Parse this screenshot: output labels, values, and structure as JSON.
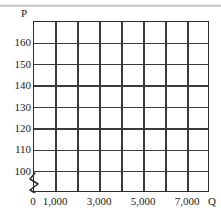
{
  "chart_data": {
    "type": "line",
    "title": "",
    "subtitle": "",
    "xlabel": "Q",
    "ylabel": "P",
    "series": [],
    "x": [],
    "values": [],
    "grid": true,
    "legend": "none",
    "note": "Empty plotting grid (blank graph paper) — no data series are drawn.",
    "xlim": [
      0,
      8000
    ],
    "ylim": [
      95,
      170
    ],
    "x_gridline_values": [
      0,
      1000,
      2000,
      3000,
      4000,
      5000,
      6000,
      7000,
      8000
    ],
    "x_tick_labels": [
      "0",
      "1,000",
      "3,000",
      "5,000",
      "7,000"
    ],
    "x_tick_label_values": [
      0,
      1000,
      3000,
      5000,
      7000
    ],
    "y_gridline_values": [
      100,
      110,
      120,
      130,
      140,
      150,
      160
    ],
    "y_tick_labels": [
      "100",
      "110",
      "120",
      "130",
      "140",
      "150",
      "160"
    ],
    "y_tick_label_values": [
      100,
      110,
      120,
      130,
      140,
      150,
      160
    ],
    "columns": 8,
    "rows": 8,
    "axis_break": true,
    "axis_break_axis": "y",
    "axis_break_below": 100
  },
  "axes": {
    "y_axis_name": "P",
    "x_axis_name": "Q"
  },
  "colors": {
    "grid_line": "#3a3a3a",
    "plot_border": "#2b2b2b",
    "text": "#1a1a1a",
    "background": "#ffffff"
  }
}
